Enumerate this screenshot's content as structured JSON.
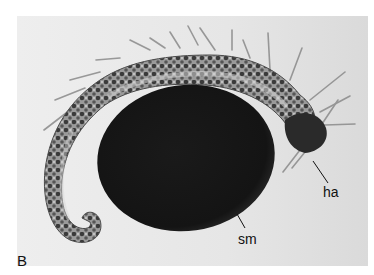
{
  "figure": {
    "panel_letter": "B",
    "annotations": [
      {
        "id": "ha",
        "text": "ha"
      },
      {
        "id": "sm",
        "text": "sm"
      }
    ],
    "colors": {
      "background": "#ffffff",
      "photo_background": "#e9e9e9",
      "sphere": "#141414",
      "body_dark": "#3a3a3a",
      "body_light": "#b8b8b8",
      "bristle": "#8a8a8a",
      "text": "#111111"
    }
  }
}
